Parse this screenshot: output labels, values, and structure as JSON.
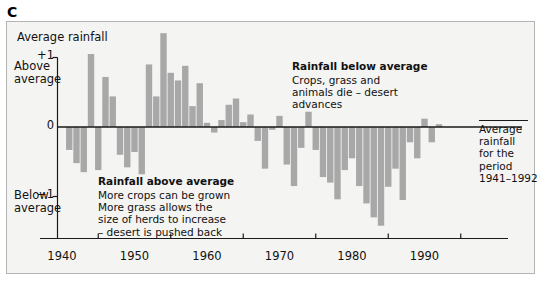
{
  "figure": {
    "panel_letter": "C",
    "axis_title": "Average rainfall",
    "y_labels": {
      "plus1": "+1",
      "zero": "0",
      "minus1": "−1"
    },
    "y_side": {
      "above": "Above\naverage",
      "below": "Below\naverage"
    },
    "x_ticks": [
      "1940",
      "1950",
      "1960",
      "1970",
      "1980",
      "1990"
    ],
    "annotations": {
      "below_average": {
        "title": "Rainfall below average",
        "body": "Crops, grass and\nanimals die – desert\nadvances"
      },
      "above_average": {
        "title": "Rainfall above average",
        "body": "More crops can be grown\nMore grass allows the\nsize of herds to increase\n– desert is pushed back"
      }
    },
    "side_note": "Average rainfall\nfor the period\n1941–1992",
    "colors": {
      "bar": "#a8a8a8",
      "background": "#f4f4f2",
      "frame": "#b4b4b2",
      "axis": "#1a1a1a",
      "text": "#111111"
    }
  },
  "chart_data": {
    "type": "bar",
    "title": "Average rainfall",
    "subtitle": "Rainfall anomaly relative to the 1941–1992 average",
    "xlabel": "Year",
    "ylabel": "Average rainfall (standardised anomaly)",
    "xlim": [
      1940.5,
      1993.5
    ],
    "ylim": [
      -1.75,
      1.5
    ],
    "ytick_values": [
      1,
      0,
      -1
    ],
    "ytick_labels": [
      "+1",
      "0",
      "−1"
    ],
    "xtick_values": [
      1940,
      1950,
      1960,
      1970,
      1980,
      1990
    ],
    "xtick_labels": [
      "1940",
      "1950",
      "1960",
      "1970",
      "1980",
      "1990"
    ],
    "grid": false,
    "legend": null,
    "baseline": 0,
    "x": [
      1941,
      1942,
      1943,
      1944,
      1945,
      1946,
      1947,
      1948,
      1949,
      1950,
      1951,
      1952,
      1953,
      1954,
      1955,
      1956,
      1957,
      1958,
      1959,
      1960,
      1961,
      1962,
      1963,
      1964,
      1965,
      1966,
      1967,
      1968,
      1969,
      1970,
      1971,
      1972,
      1973,
      1974,
      1975,
      1976,
      1977,
      1978,
      1979,
      1980,
      1981,
      1982,
      1983,
      1984,
      1985,
      1986,
      1987,
      1988,
      1989,
      1990,
      1991,
      1992
    ],
    "values": [
      -0.33,
      -0.52,
      -0.65,
      1.05,
      -0.62,
      0.72,
      0.44,
      -0.4,
      -0.58,
      -0.36,
      -0.68,
      0.9,
      0.44,
      1.35,
      0.78,
      0.67,
      0.88,
      0.3,
      0.63,
      0.06,
      -0.08,
      0.1,
      0.32,
      0.41,
      0.07,
      0.18,
      -0.2,
      -0.6,
      -0.04,
      0.16,
      -0.54,
      -0.85,
      -0.3,
      0.22,
      -0.33,
      -0.72,
      -0.8,
      -1.04,
      -0.62,
      -0.45,
      -0.85,
      -1.1,
      -1.3,
      -1.42,
      -0.86,
      -0.6,
      -1.05,
      -0.22,
      -0.45,
      0.12,
      -0.22,
      0.04
    ],
    "series": [
      {
        "name": "Rainfall anomaly",
        "color": "#a8a8a8",
        "values": [
          -0.33,
          -0.52,
          -0.65,
          1.05,
          -0.62,
          0.72,
          0.44,
          -0.4,
          -0.58,
          -0.36,
          -0.68,
          0.9,
          0.44,
          1.35,
          0.78,
          0.67,
          0.88,
          0.3,
          0.63,
          0.06,
          -0.08,
          0.1,
          0.32,
          0.41,
          0.07,
          0.18,
          -0.2,
          -0.6,
          -0.04,
          0.16,
          -0.54,
          -0.85,
          -0.3,
          0.22,
          -0.33,
          -0.72,
          -0.8,
          -1.04,
          -0.62,
          -0.45,
          -0.85,
          -1.1,
          -1.3,
          -1.42,
          -0.86,
          -0.6,
          -1.05,
          -0.22,
          -0.45,
          0.12,
          -0.22,
          0.04
        ]
      }
    ],
    "annotations": [
      {
        "text": "Rainfall below average — Crops, grass and animals die – desert advances",
        "x": 1976,
        "y": 1.0
      },
      {
        "text": "Rainfall above average — More crops can be grown; More grass allows the size of herds to increase – desert is pushed back",
        "x": 1953,
        "y": -0.6
      },
      {
        "text": "Average rainfall for the period 1941–1992",
        "x": 1993,
        "y": 0.0
      }
    ]
  }
}
